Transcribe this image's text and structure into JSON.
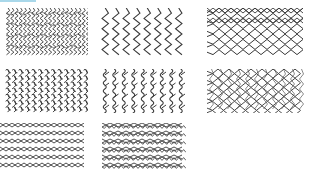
{
  "top_accent": {
    "color": "#a9d8ea",
    "width": 36
  },
  "pattern_color": "#3a3a3a",
  "grid": {
    "columns": 3,
    "rows": 3,
    "panels": [
      {
        "id": "p1",
        "pattern": "dense-zigzag-vertical",
        "x": 6,
        "y": 8,
        "w": 82,
        "h": 48
      },
      {
        "id": "p2",
        "pattern": "vertical-chevron-columns",
        "x": 100,
        "y": 8,
        "w": 86,
        "h": 48
      },
      {
        "id": "p3",
        "pattern": "diamond-loops",
        "x": 207,
        "y": 8,
        "w": 96,
        "h": 48
      },
      {
        "id": "p4",
        "pattern": "hook-link-mesh",
        "x": 5,
        "y": 69,
        "w": 83,
        "h": 44
      },
      {
        "id": "p5",
        "pattern": "wavy-hook-columns",
        "x": 100,
        "y": 69,
        "w": 86,
        "h": 44
      },
      {
        "id": "p6",
        "pattern": "overlapping-diamonds",
        "x": 207,
        "y": 69,
        "w": 98,
        "h": 44
      },
      {
        "id": "p7",
        "pattern": "open-diamond-lattice",
        "x": 0,
        "y": 123,
        "w": 86,
        "h": 47
      },
      {
        "id": "p8",
        "pattern": "zigzag-diamond-lattice",
        "x": 102,
        "y": 123,
        "w": 84,
        "h": 47
      }
    ]
  }
}
